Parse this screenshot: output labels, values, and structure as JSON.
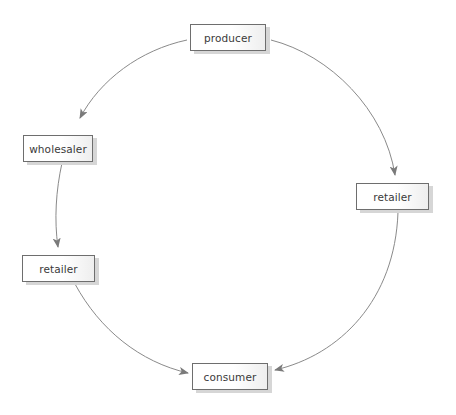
{
  "diagram": {
    "type": "flow",
    "colors": {
      "edge": "#7a7a7a",
      "node_border": "#6e6e6e",
      "node_shadow": "#d6d6d6",
      "text": "#3a3a3a"
    },
    "nodes": [
      {
        "id": "producer",
        "label": "producer"
      },
      {
        "id": "wholesaler",
        "label": "wholesaler"
      },
      {
        "id": "retailer_left",
        "label": "retailer"
      },
      {
        "id": "retailer_right",
        "label": "retailer"
      },
      {
        "id": "consumer",
        "label": "consumer"
      }
    ],
    "edges": [
      {
        "from": "producer",
        "to": "wholesaler"
      },
      {
        "from": "wholesaler",
        "to": "retailer_left"
      },
      {
        "from": "retailer_left",
        "to": "consumer"
      },
      {
        "from": "producer",
        "to": "retailer_right"
      },
      {
        "from": "retailer_right",
        "to": "consumer"
      }
    ]
  }
}
